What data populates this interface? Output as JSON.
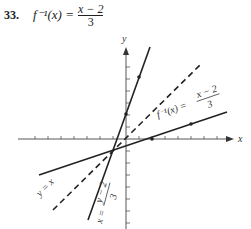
{
  "problem": {
    "number": "33.",
    "function_lhs": "f⁻¹(x) =",
    "numerator": "x − 2",
    "denominator": "3"
  },
  "graph": {
    "x_axis_label": "x",
    "y_axis_label": "y",
    "labels": {
      "inverse": "f⁻¹(x) = (x − 2)/3",
      "inverse_num": "x − 2",
      "inverse_den": "3",
      "identity": "y = x",
      "original_lhs": "x =",
      "original_num": "y − 2",
      "original_den": "3"
    },
    "lines": [
      {
        "name": "f-inverse",
        "equation": "y = (x - 2)/3",
        "style": "solid"
      },
      {
        "name": "identity",
        "equation": "y = x",
        "style": "dashed"
      },
      {
        "name": "f",
        "equation": "y = 3x + 2",
        "style": "solid"
      }
    ]
  }
}
